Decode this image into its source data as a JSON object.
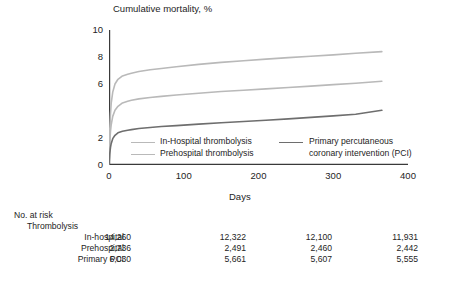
{
  "chart_data": {
    "type": "line",
    "title": "Cumulative mortality, %",
    "xlabel": "Days",
    "ylabel": "Cumulative mortality, %",
    "xlim": [
      0,
      400
    ],
    "ylim": [
      0,
      10
    ],
    "xticks": [
      0,
      100,
      200,
      300,
      400
    ],
    "xtick_labels": [
      "0",
      "100",
      "200",
      "300",
      "400"
    ],
    "yticks": [
      0,
      2,
      4,
      6,
      8,
      10
    ],
    "ytick_labels": [
      "0",
      "2",
      "",
      "6",
      "8",
      "10"
    ],
    "grid": false,
    "legend_position": "inside-lower-center",
    "series": [
      {
        "name": "In-Hospital thrombolysis",
        "color": "#b9b9b9",
        "x": [
          0,
          1,
          2,
          3,
          5,
          8,
          12,
          18,
          25,
          30,
          40,
          55,
          70,
          90,
          120,
          150,
          180,
          210,
          240,
          270,
          300,
          330,
          365
        ],
        "y": [
          0,
          2.6,
          3.8,
          4.6,
          5.4,
          6.0,
          6.35,
          6.6,
          6.72,
          6.8,
          6.92,
          7.05,
          7.15,
          7.28,
          7.45,
          7.6,
          7.72,
          7.84,
          7.95,
          8.06,
          8.16,
          8.28,
          8.4
        ]
      },
      {
        "name": "Prehospital thrombolysis",
        "color": "#b9b9b9",
        "x": [
          0,
          1,
          2,
          3,
          5,
          8,
          12,
          18,
          25,
          30,
          40,
          55,
          70,
          90,
          120,
          150,
          180,
          210,
          240,
          270,
          300,
          330,
          365
        ],
        "y": [
          0,
          1.7,
          2.5,
          3.0,
          3.6,
          4.05,
          4.35,
          4.6,
          4.72,
          4.8,
          4.9,
          5.0,
          5.08,
          5.18,
          5.32,
          5.44,
          5.54,
          5.64,
          5.74,
          5.84,
          5.95,
          6.06,
          6.2
        ]
      },
      {
        "name": "Primary percutaneous coronary intervention (PCI)",
        "color": "#6e6e6e",
        "x": [
          0,
          1,
          2,
          3,
          5,
          8,
          12,
          18,
          25,
          30,
          40,
          55,
          70,
          90,
          120,
          150,
          180,
          210,
          240,
          270,
          300,
          330,
          365
        ],
        "y": [
          0,
          0.85,
          1.3,
          1.6,
          1.95,
          2.2,
          2.38,
          2.5,
          2.58,
          2.62,
          2.7,
          2.78,
          2.85,
          2.92,
          3.03,
          3.13,
          3.22,
          3.32,
          3.42,
          3.53,
          3.64,
          3.76,
          4.05
        ]
      }
    ],
    "legend": [
      {
        "label": "In-Hospital thrombolysis",
        "color": "#b9b9b9"
      },
      {
        "label": "Prehospital thrombolysis",
        "color": "#b9b9b9"
      },
      {
        "label_line1": "Primary percutaneous",
        "label_line2": "coronary intervention (PCI)",
        "color": "#6e6e6e"
      }
    ],
    "risk_table": {
      "title": "No. at risk",
      "group_label": "Thrombolysis",
      "columns": [
        "0",
        "100",
        "200",
        "300"
      ],
      "rows": [
        {
          "label": "In-hospital",
          "values": [
            "14,260",
            "12,322",
            "12,100",
            "11,931"
          ]
        },
        {
          "label": "Prehospital",
          "values": [
            "2,736",
            "2,491",
            "2,460",
            "2,442"
          ]
        },
        {
          "label": "Primary PCI",
          "values": [
            "6,030",
            "5,661",
            "5,607",
            "5,555"
          ]
        }
      ]
    }
  }
}
